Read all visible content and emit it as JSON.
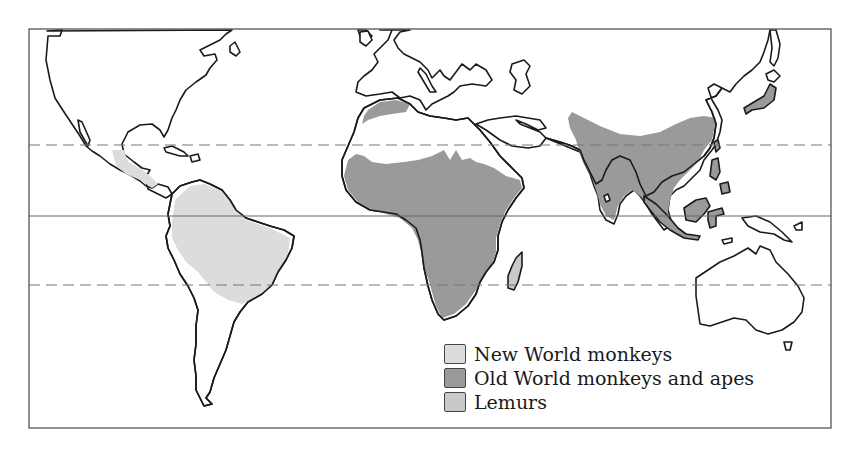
{
  "map": {
    "frame": {
      "x": 29,
      "y": 29,
      "width": 802,
      "height": 399
    },
    "latitude_lines": [
      {
        "name": "tropic-of-cancer",
        "y": 145,
        "style": "dashed"
      },
      {
        "name": "equator",
        "y": 216,
        "style": "solid"
      },
      {
        "name": "tropic-of-capricorn",
        "y": 285,
        "style": "dashed"
      }
    ]
  },
  "legend": {
    "items": [
      {
        "label": "New World monkeys",
        "color": "#dcdcdc"
      },
      {
        "label": "Old World monkeys and apes",
        "color": "#9a9a9a"
      },
      {
        "label": "Lemurs",
        "color": "#c9c9c9"
      }
    ]
  }
}
